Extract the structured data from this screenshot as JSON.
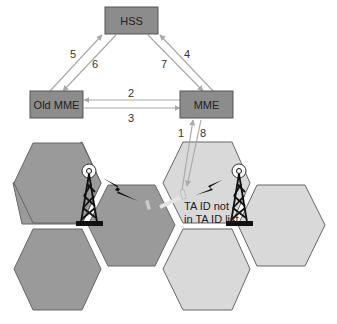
{
  "colors": {
    "node_fill": "#8c8c8c",
    "node_stroke": "#555555",
    "arrow": "#aaaaaa",
    "old_cell_fill": "#9a9a9a",
    "new_cell_fill": "#d9d9d9",
    "cell_stroke": "#666666",
    "tower": "#111111"
  },
  "nodes": {
    "hss": "HSS",
    "old_mme": "Old MME",
    "mme": "MME"
  },
  "steps": {
    "s1": "1",
    "s2": "2",
    "s3": "3",
    "s4": "4",
    "s5": "5",
    "s6": "6",
    "s7": "7",
    "s8": "8"
  },
  "note": {
    "line1": "TA ID not",
    "line2": "in TA ID list"
  },
  "icons": {
    "tower_left": "cell-tower-icon",
    "tower_right": "cell-tower-icon",
    "signal_left": "lightning-icon",
    "signal_right": "lightning-icon",
    "ue": "mobile-phone-icon"
  }
}
